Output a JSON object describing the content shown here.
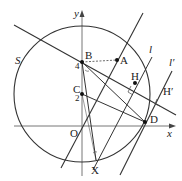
{
  "figure": {
    "circle_label": "S",
    "axes": {
      "x_label": "x",
      "y_label": "y",
      "origin_label": "O"
    },
    "points": {
      "A": "A",
      "B": "B",
      "C": "C",
      "D": "D",
      "H": "H",
      "H_prime": "H′",
      "X": "X"
    },
    "tick_labels": {
      "B_y": "4",
      "C_y": "2"
    },
    "lines": {
      "l": "l",
      "l_prime": "l′"
    }
  }
}
